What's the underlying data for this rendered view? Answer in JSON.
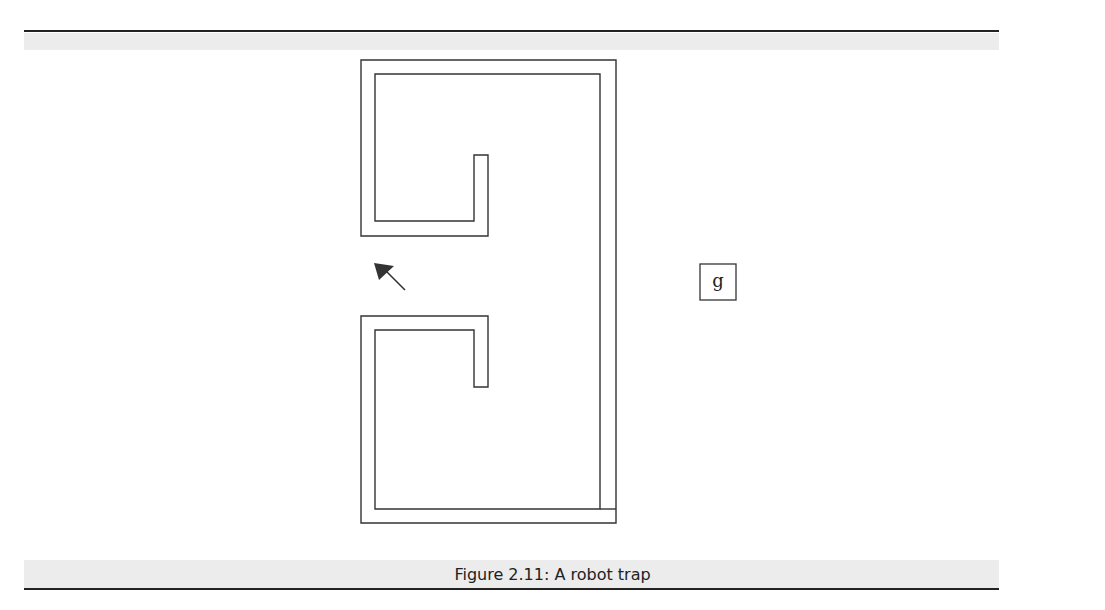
{
  "figure": {
    "caption": "Figure 2.11: A robot trap",
    "goal_label": "g",
    "colors": {
      "line": "#333333",
      "rule": "#222222",
      "bleed": "#ececec"
    },
    "elements": {
      "trap_walls": "C-shaped double-line wall enclosure with two inward hooks",
      "robot": "arrow pointing up-left (robot heading)",
      "goal": "boxed letter g"
    }
  }
}
